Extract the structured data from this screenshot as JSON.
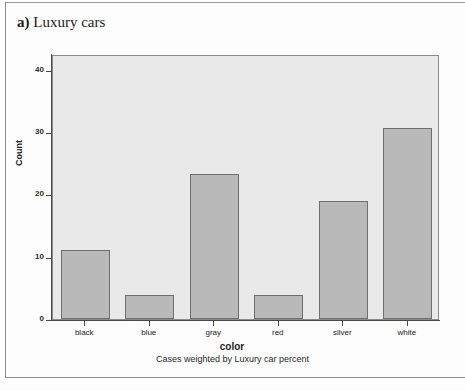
{
  "caption": {
    "marker": "a)",
    "text": "Luxury cars"
  },
  "chart_data": {
    "type": "bar",
    "title": "",
    "categories": [
      "black",
      "blue",
      "gray",
      "red",
      "silver",
      "white"
    ],
    "values": [
      11.0,
      3.8,
      23.2,
      3.8,
      18.9,
      30.6
    ],
    "xlabel": "color",
    "ylabel": "Count",
    "ylim": [
      0,
      42.5
    ],
    "yticks": [
      0,
      10,
      20,
      30,
      40
    ],
    "ytick_labels": [
      "0",
      "10",
      "20",
      "30",
      "40"
    ],
    "grid": false,
    "legend": false,
    "footnote": "Cases weighted by Luxury car percent",
    "bar_color": "#b9b9b9",
    "bar_border_color": "#6e6e6e",
    "plot_background": "#e9e9e9",
    "axis_color": "#4a4a4a"
  }
}
